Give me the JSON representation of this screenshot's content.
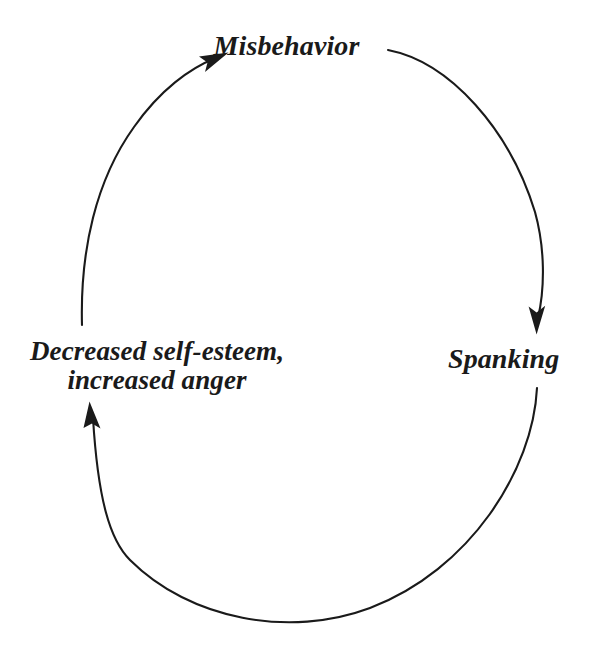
{
  "diagram": {
    "type": "cycle-diagram",
    "background_color": "#ffffff",
    "stroke_color": "#1a1a1a",
    "text_color": "#1a1a1a",
    "nodes": [
      {
        "id": "misbehavior",
        "label": "Misbehavior",
        "position": "top"
      },
      {
        "id": "spanking",
        "label": "Spanking",
        "position": "right"
      },
      {
        "id": "self-esteem",
        "label_line1": "Decreased self-esteem,",
        "label_line2": "increased anger",
        "position": "left"
      }
    ],
    "arrows": [
      {
        "from": "misbehavior",
        "to": "spanking",
        "direction": "down",
        "side": "right"
      },
      {
        "from": "spanking",
        "to": "self-esteem",
        "direction": "up-left",
        "side": "bottom"
      },
      {
        "from": "self-esteem",
        "to": "misbehavior",
        "direction": "up-right",
        "side": "left"
      }
    ]
  }
}
